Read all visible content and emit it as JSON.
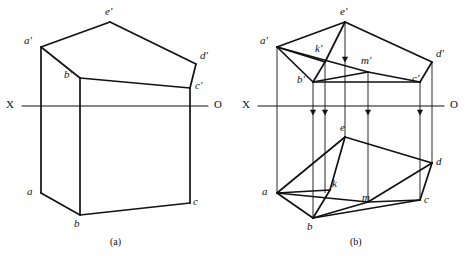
{
  "figure": {
    "captions": [
      {
        "id": "caption-a",
        "text": "(a)",
        "x": 110,
        "y": 236
      },
      {
        "id": "caption-b",
        "text": "(b)",
        "x": 350,
        "y": 236
      }
    ]
  },
  "axis": {
    "label_left": "X",
    "label_right": "O",
    "color": "#111111"
  },
  "diagram_a": {
    "name": "projection-without-auxiliary-points",
    "axis": {
      "x1": 22,
      "y1": 106,
      "x2": 208,
      "y2": 106,
      "label_left_x": 6,
      "label_left_y": 99,
      "label_right_x": 214,
      "label_right_y": 99
    },
    "points": [
      {
        "id": "a-prime",
        "label": "a'",
        "x": 41,
        "y": 47,
        "lx": 24,
        "ly": 35
      },
      {
        "id": "e-prime",
        "label": "e'",
        "x": 110,
        "y": 22,
        "lx": 105,
        "ly": 6
      },
      {
        "id": "d-prime",
        "label": "d'",
        "x": 196,
        "y": 64,
        "lx": 200,
        "ly": 50
      },
      {
        "id": "c-prime",
        "label": "c'",
        "x": 190,
        "y": 88,
        "lx": 195,
        "ly": 80
      },
      {
        "id": "b-prime",
        "label": "b'",
        "x": 80,
        "y": 78,
        "lx": 64,
        "ly": 69
      },
      {
        "id": "a",
        "label": "a",
        "x": 41,
        "y": 193,
        "lx": 27,
        "ly": 186
      },
      {
        "id": "b",
        "label": "b",
        "x": 80,
        "y": 215,
        "lx": 74,
        "ly": 218
      },
      {
        "id": "c",
        "label": "c",
        "x": 190,
        "y": 203,
        "lx": 193,
        "ly": 196
      }
    ],
    "edges": [
      {
        "id": "ap-ep",
        "from": "a-prime",
        "to": "e-prime"
      },
      {
        "id": "ep-dp",
        "from": "e-prime",
        "to": "d-prime"
      },
      {
        "id": "dp-cp",
        "from": "d-prime",
        "to": "c-prime"
      },
      {
        "id": "cp-bp",
        "from": "c-prime",
        "to": "b-prime"
      },
      {
        "id": "bp-ap",
        "from": "b-prime",
        "to": "a-prime"
      },
      {
        "id": "ap-a",
        "from": "a-prime",
        "to": "a"
      },
      {
        "id": "bp-b",
        "from": "b-prime",
        "to": "b"
      },
      {
        "id": "cp-c",
        "from": "c-prime",
        "to": "c"
      },
      {
        "id": "a-b",
        "from": "a",
        "to": "b"
      },
      {
        "id": "b-c",
        "from": "b",
        "to": "c"
      }
    ]
  },
  "diagram_b": {
    "name": "projection-with-auxiliary-points-k-and-m",
    "axis": {
      "x1": 258,
      "y1": 106,
      "x2": 444,
      "y2": 106,
      "label_left_x": 242,
      "label_left_y": 99,
      "label_right_x": 450,
      "label_right_y": 99
    },
    "points": [
      {
        "id": "a-prime",
        "label": "a'",
        "x": 277,
        "y": 47,
        "lx": 260,
        "ly": 35
      },
      {
        "id": "e-prime",
        "label": "e'",
        "x": 345,
        "y": 22,
        "lx": 340,
        "ly": 6
      },
      {
        "id": "d-prime",
        "label": "d'",
        "x": 432,
        "y": 62,
        "lx": 436,
        "ly": 48
      },
      {
        "id": "c-prime",
        "label": "c'",
        "x": 420,
        "y": 82,
        "lx": 412,
        "ly": 73
      },
      {
        "id": "b-prime",
        "label": "b'",
        "x": 313,
        "y": 82,
        "lx": 297,
        "ly": 74
      },
      {
        "id": "k-prime",
        "label": "k'",
        "x": 325,
        "y": 62,
        "lx": 315,
        "ly": 43
      },
      {
        "id": "m-prime",
        "label": "m'",
        "x": 368,
        "y": 72,
        "lx": 361,
        "ly": 55
      },
      {
        "id": "a",
        "label": "a",
        "x": 277,
        "y": 193,
        "lx": 262,
        "ly": 186
      },
      {
        "id": "b",
        "label": "b",
        "x": 313,
        "y": 218,
        "lx": 307,
        "ly": 221
      },
      {
        "id": "c",
        "label": "c",
        "x": 420,
        "y": 200,
        "lx": 424,
        "ly": 194
      },
      {
        "id": "d",
        "label": "d",
        "x": 432,
        "y": 163,
        "lx": 436,
        "ly": 156
      },
      {
        "id": "e",
        "label": "e",
        "x": 345,
        "y": 137,
        "lx": 340,
        "ly": 122
      },
      {
        "id": "k",
        "label": "k",
        "x": 330,
        "y": 190,
        "lx": 332,
        "ly": 178
      },
      {
        "id": "m",
        "label": "m",
        "x": 368,
        "y": 202,
        "lx": 362,
        "ly": 192
      }
    ],
    "edges": [
      {
        "id": "ap-ep",
        "from": "a-prime",
        "to": "e-prime"
      },
      {
        "id": "ep-dp",
        "from": "e-prime",
        "to": "d-prime"
      },
      {
        "id": "dp-cp",
        "from": "d-prime",
        "to": "c-prime"
      },
      {
        "id": "cp-bp",
        "from": "c-prime",
        "to": "b-prime"
      },
      {
        "id": "bp-ap",
        "from": "b-prime",
        "to": "a-prime"
      },
      {
        "id": "ap-kp",
        "from": "a-prime",
        "to": "k-prime"
      },
      {
        "id": "ap-mp",
        "from": "a-prime",
        "to": "m-prime"
      },
      {
        "id": "ep-kp",
        "from": "e-prime",
        "to": "k-prime"
      },
      {
        "id": "bp-mp",
        "from": "b-prime",
        "to": "m-prime"
      },
      {
        "id": "mp-cp",
        "from": "m-prime",
        "to": "c-prime"
      },
      {
        "id": "kp-bp",
        "from": "k-prime",
        "to": "b-prime"
      },
      {
        "id": "a-e",
        "from": "a",
        "to": "e"
      },
      {
        "id": "e-d",
        "from": "e",
        "to": "d"
      },
      {
        "id": "d-c",
        "from": "d",
        "to": "c"
      },
      {
        "id": "c-b",
        "from": "c",
        "to": "b"
      },
      {
        "id": "b-a",
        "from": "b",
        "to": "a"
      },
      {
        "id": "a-k",
        "from": "a",
        "to": "k"
      },
      {
        "id": "a-m",
        "from": "a",
        "to": "m"
      },
      {
        "id": "e-k",
        "from": "e",
        "to": "k"
      },
      {
        "id": "b-k",
        "from": "b",
        "to": "k"
      },
      {
        "id": "b-m",
        "from": "b",
        "to": "m"
      },
      {
        "id": "m-c",
        "from": "m",
        "to": "c"
      },
      {
        "id": "m-d",
        "from": "m",
        "to": "d"
      }
    ],
    "projectors": [
      {
        "id": "proj-bp-b",
        "x": 313,
        "y1": 82,
        "y2": 218,
        "arrow_y": 115
      },
      {
        "id": "proj-kp-k",
        "x": 325,
        "y1": 62,
        "y2": 193,
        "arrow_y": 115
      },
      {
        "id": "proj-ep-e",
        "x": 345,
        "y1": 22,
        "y2": 137,
        "arrow_y": 62
      },
      {
        "id": "proj-mp-m",
        "x": 368,
        "y1": 72,
        "y2": 202,
        "arrow_y": 115
      },
      {
        "id": "proj-cp-c",
        "x": 420,
        "y1": 82,
        "y2": 200,
        "arrow_y": 115
      },
      {
        "id": "proj-ap-a",
        "x": 277,
        "y1": 47,
        "y2": 193,
        "arrow_y": -1
      },
      {
        "id": "proj-dp-d",
        "x": 432,
        "y1": 62,
        "y2": 163,
        "arrow_y": -1
      }
    ]
  }
}
